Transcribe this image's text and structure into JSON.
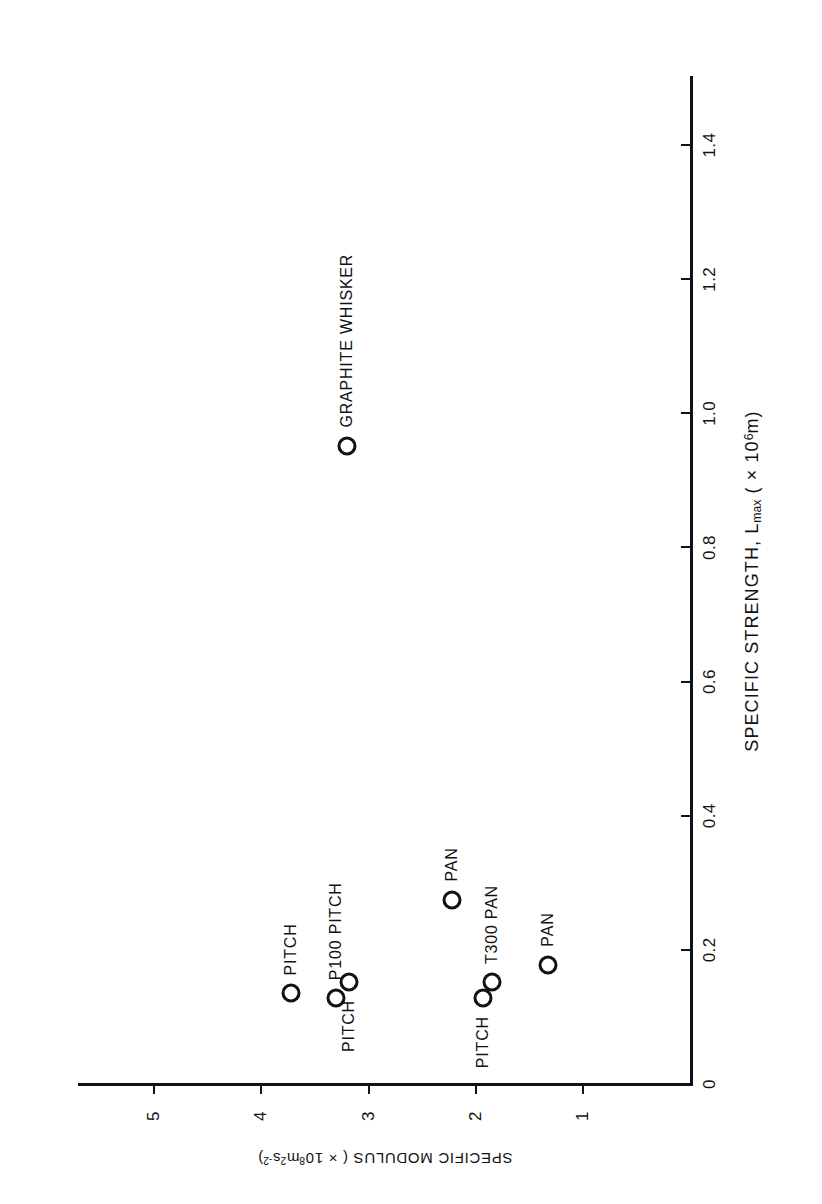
{
  "chart_data": {
    "type": "scatter",
    "title": "",
    "xlabel": "SPECIFIC STRENGTH, Lmax ( × 10⁶m)",
    "ylabel": "SPECIFIC MODULUS ( × 10⁸m²s⁻²)",
    "xlim": [
      0,
      1.5
    ],
    "ylim": [
      0,
      5.6
    ],
    "grid": false,
    "legend": "none",
    "xticks": [
      "0",
      "0.2",
      "0.4",
      "0.6",
      "0.8",
      "1.0",
      "1.2",
      "1.4"
    ],
    "xtick_values": [
      0,
      0.2,
      0.4,
      0.6,
      0.8,
      1.0,
      1.2,
      1.4
    ],
    "yticks": [
      "1",
      "2",
      "3",
      "4",
      "5"
    ],
    "ytick_values": [
      1,
      2,
      3,
      4,
      5
    ],
    "points": [
      {
        "label": "PITCH",
        "x": 0.135,
        "y": 3.72,
        "label_side": "right"
      },
      {
        "label": "P100 PITCH",
        "x": 0.128,
        "y": 3.3,
        "label_side": "right"
      },
      {
        "label": "PITCH",
        "x": 0.152,
        "y": 3.18,
        "label_side": "left"
      },
      {
        "label": "PAN",
        "x": 0.275,
        "y": 2.22,
        "label_side": "right"
      },
      {
        "label": "PITCH",
        "x": 0.128,
        "y": 1.93,
        "label_side": "left"
      },
      {
        "label": "T300 PAN",
        "x": 0.152,
        "y": 1.85,
        "label_side": "right"
      },
      {
        "label": "PAN",
        "x": 0.178,
        "y": 1.33,
        "label_side": "right"
      },
      {
        "label": "GRAPHITE WHISKER",
        "x": 0.952,
        "y": 3.2,
        "label_side": "right"
      }
    ]
  },
  "axis_titles": {
    "x_main": "SPECIFIC STRENGTH, L",
    "x_sub": "max",
    "x_tail_open": " ( × 10",
    "x_sup": "6",
    "x_tail_close": "m)",
    "y_main": "SPECIFIC MODULUS ( × 10",
    "y_sup1": "8",
    "y_mid": "m",
    "y_sup2": "2",
    "y_mid2": "s",
    "y_sup3": "-2",
    "y_tail": ")"
  },
  "colors": {
    "ink": "#111111",
    "background": "#ffffff"
  }
}
